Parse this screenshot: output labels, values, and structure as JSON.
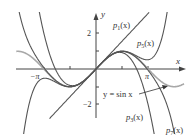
{
  "chart_data": {
    "type": "line",
    "title": "",
    "xlabel": "x",
    "ylabel": "y",
    "xlim": [
      -4.8,
      5.4
    ],
    "ylim": [
      -3.6,
      3.1
    ],
    "x_ticks": [
      {
        "value": -3.14159,
        "label": "−π"
      },
      {
        "value": -1.5708,
        "label": ""
      },
      {
        "value": 1.5708,
        "label": ""
      },
      {
        "value": 3.14159,
        "label": "π"
      }
    ],
    "y_ticks": [
      {
        "value": 2,
        "label": "2"
      },
      {
        "value": 1,
        "label": ""
      },
      {
        "value": -1,
        "label": ""
      },
      {
        "value": -2,
        "label": "−2"
      }
    ],
    "grid": false,
    "series": [
      {
        "name": "y = sin x",
        "function": "sin(x)",
        "color": "#a8a8a8"
      },
      {
        "name": "p1(x)",
        "function": "x",
        "color": "#555555"
      },
      {
        "name": "p3(x)",
        "function": "x - x^3/6",
        "color": "#555555"
      },
      {
        "name": "p5(x)",
        "function": "x - x^3/6 + x^5/120",
        "color": "#555555"
      },
      {
        "name": "p7(x)",
        "function": "x - x^3/6 + x^5/120 - x^7/5040",
        "color": "#555555"
      }
    ],
    "annotations": [
      {
        "text": "p1(x)",
        "target": "p1(x)"
      },
      {
        "text": "p5(x)",
        "target": "p5(x)"
      },
      {
        "text": "y = sin x",
        "target": "y = sin x",
        "arrow": true
      },
      {
        "text": "p3(x)",
        "target": "p3(x)"
      },
      {
        "text": "p7(x)",
        "target": "p7(x)"
      }
    ]
  },
  "labels": {
    "x_axis": "x",
    "y_axis": "y",
    "tick_2": "2",
    "tick_neg2": "−2",
    "tick_neg_pi": "−π",
    "tick_pi": "π",
    "p1_main": "p",
    "p1_sub": "1",
    "p1_arg": "(x)",
    "p5_main": "p",
    "p5_sub": "5",
    "p5_arg": "(x)",
    "p3_main": "p",
    "p3_sub": "3",
    "p3_arg": "(x)",
    "p7_main": "p",
    "p7_sub": "7",
    "p7_arg": "(x)",
    "sin_label": "y = sin x"
  },
  "colors": {
    "axis": "#444444",
    "curve": "#555555",
    "sin_curve": "#a8a8a8"
  }
}
